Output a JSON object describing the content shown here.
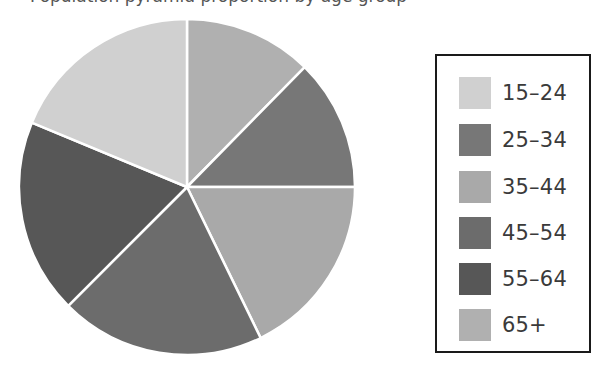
{
  "caption": "Population pyramid proportion by age group",
  "chart_data": {
    "type": "pie",
    "title": "",
    "categories": [
      "15–24",
      "25–34",
      "35–44",
      "45–54",
      "55–64",
      "65+"
    ],
    "values": [
      19,
      13,
      18,
      20,
      18,
      12
    ],
    "colors": [
      "#d0d0d0",
      "#777777",
      "#a9a9a9",
      "#6c6c6c",
      "#575757",
      "#b0b0b0"
    ],
    "legend_position": "right",
    "slice_order_clockwise_from_top": [
      "65+",
      "25–34",
      "35–44",
      "45–54",
      "55–64",
      "15–24"
    ],
    "slice_angles_deg": {
      "65+": [
        0,
        44.5
      ],
      "25–34": [
        44.5,
        90
      ],
      "35–44": [
        90,
        154
      ],
      "45–54": [
        154,
        225
      ],
      "55–64": [
        225,
        292.5
      ],
      "15–24": [
        292.5,
        360
      ]
    }
  },
  "legend": {
    "items": [
      {
        "label": "15–24",
        "color": "#d0d0d0"
      },
      {
        "label": "25–34",
        "color": "#777777"
      },
      {
        "label": "35–44",
        "color": "#a9a9a9"
      },
      {
        "label": "45–54",
        "color": "#6c6c6c"
      },
      {
        "label": "55–64",
        "color": "#575757"
      },
      {
        "label": "65+",
        "color": "#b0b0b0"
      }
    ]
  }
}
